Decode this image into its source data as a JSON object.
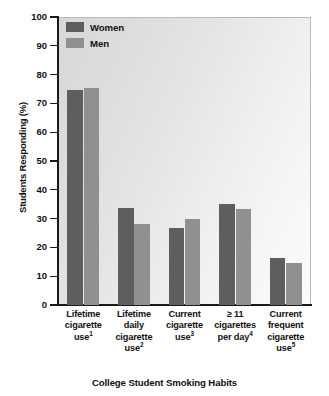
{
  "chart_data": {
    "type": "bar",
    "title": "",
    "xlabel": "College Student Smoking Habits",
    "ylabel": "Students Responding (%)",
    "ylim": [
      0,
      100
    ],
    "ytick_step": 10,
    "yticks": [
      "100",
      "90",
      "80",
      "70",
      "60",
      "50",
      "40",
      "30",
      "20",
      "10",
      "0"
    ],
    "grid": false,
    "legend_position": "top-left",
    "categories": [
      "Lifetime cigarette use",
      "Lifetime daily cigarette use",
      "Current cigarette use",
      "≥ 11 cigarettes per day",
      "Current frequent cigarette use"
    ],
    "category_lines": [
      [
        "Lifetime",
        "cigarette",
        "use"
      ],
      [
        "Lifetime",
        "daily",
        "cigarette",
        "use"
      ],
      [
        "Current",
        "cigarette",
        "use"
      ],
      [
        "≥ 11",
        "cigarettes",
        "per day"
      ],
      [
        "Current",
        "frequent",
        "cigarette",
        "use"
      ]
    ],
    "category_footnotes": [
      "1",
      "2",
      "3",
      "4",
      "5"
    ],
    "series": [
      {
        "name": "Women",
        "color": "#5e5e5e",
        "values": [
          74.5,
          33.8,
          26.6,
          35.2,
          16.2
        ]
      },
      {
        "name": "Men",
        "color": "#909090",
        "values": [
          75.4,
          28.2,
          30.0,
          33.2,
          14.5
        ]
      }
    ]
  },
  "legend": {
    "items": [
      {
        "label": "Women",
        "color": "#5e5e5e"
      },
      {
        "label": "Men",
        "color": "#909090"
      }
    ]
  },
  "colors": {
    "women": "#5e5e5e",
    "men": "#909090",
    "axis": "#1a1a1a",
    "plot_background_light": "#fbfbfb",
    "plot_background_dark": "#d8d8d8",
    "plot_border": "#b9b9b9"
  }
}
